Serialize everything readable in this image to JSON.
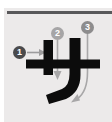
{
  "card": {
    "name": "katakana-stroke-order-card",
    "background_color": "#eceaea",
    "page_background": "#ffffff",
    "rule_color": "#58585a"
  },
  "character": {
    "glyph": "サ",
    "romaji": "sa",
    "script": "katakana",
    "ink_color": "#0c0c0c",
    "stroke_count": 3
  },
  "strokes": [
    {
      "number": "1",
      "label": "stroke-1",
      "direction": "left-to-right",
      "marker_color": "#4a4a4c",
      "guide_color": "#9d9c9d"
    },
    {
      "number": "2",
      "label": "stroke-2",
      "direction": "top-to-bottom",
      "marker_color": "#a6a5a6",
      "guide_color": "#a8a7a8"
    },
    {
      "number": "3",
      "label": "stroke-3",
      "direction": "top-down-curving-left",
      "marker_color": "#8d8c8d",
      "guide_color": "#a8a7a8"
    }
  ]
}
